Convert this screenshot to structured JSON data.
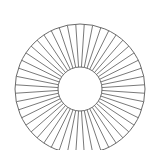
{
  "diagram": {
    "type": "annulus-with-radial-spokes",
    "center": {
      "x": 80,
      "y": 89
    },
    "outer_radius": 65,
    "inner_radius": 22,
    "spoke_count": 48,
    "angle_offset_deg": 3.75,
    "stroke_color": "#6a6a6a",
    "background": "#ffffff"
  }
}
